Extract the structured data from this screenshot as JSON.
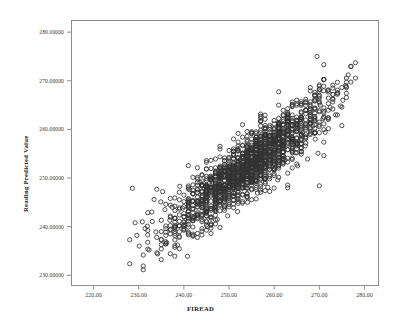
{
  "chart_data": {
    "type": "scatter",
    "title": "",
    "xlabel": "FIREAD",
    "ylabel": "Reading Predicted Value",
    "xlim": [
      215.0,
      283.0
    ],
    "ylim": [
      228.0,
      282.5
    ],
    "xticks": [
      220.0,
      230.0,
      240.0,
      250.0,
      260.0,
      270.0,
      280.0
    ],
    "xtick_labels": [
      "220.00",
      "230.00",
      "240.00",
      "250.00",
      "260.00",
      "270.00",
      "280.00"
    ],
    "yticks": [
      230.0,
      240.0,
      250.0,
      260.0,
      270.0,
      280.0
    ],
    "ytick_labels": [
      "230.00000",
      "240.00000",
      "250.00000",
      "260.00000",
      "270.00000",
      "280.00000"
    ],
    "grid": false,
    "legend": false,
    "marker": "open-circle",
    "marker_size": 4.2,
    "marker_color": "#333333",
    "n_points": 1600,
    "relationship": "strong positive linear",
    "regression": {
      "slope": 0.72,
      "intercept": 69.5,
      "r": 0.86
    },
    "x_range_data": [
      227.0,
      277.0
    ],
    "y_range_data": [
      232.5,
      275.0
    ],
    "x_mean": 254.5,
    "y_mean": 253.0,
    "x_sd": 8.6,
    "y_sd": 7.2,
    "residual_sd": 3.0,
    "points": [
      [
        228.6,
        247.9
      ],
      [
        229.2,
        240.8
      ],
      [
        229.6,
        238.2
      ],
      [
        230.1,
        236.0
      ],
      [
        230.8,
        241.0
      ],
      [
        231.4,
        239.6
      ],
      [
        231.9,
        240.1
      ],
      [
        232.3,
        235.2
      ],
      [
        232.9,
        243.0
      ],
      [
        233.4,
        245.6
      ],
      [
        233.8,
        238.9
      ],
      [
        234.2,
        234.4
      ],
      [
        234.9,
        245.1
      ],
      [
        235.3,
        247.2
      ],
      [
        235.8,
        243.5
      ],
      [
        236.2,
        236.7
      ],
      [
        236.9,
        241.3
      ],
      [
        237.4,
        244.0
      ],
      [
        238.0,
        239.0
      ],
      [
        238.6,
        236.2
      ],
      [
        239.1,
        248.3
      ],
      [
        239.7,
        243.8
      ],
      [
        240.2,
        240.5
      ],
      [
        240.8,
        233.9
      ],
      [
        241.3,
        247.6
      ],
      [
        241.9,
        245.2
      ],
      [
        242.4,
        242.0
      ],
      [
        243.0,
        238.6
      ],
      [
        243.6,
        249.1
      ],
      [
        244.1,
        246.4
      ],
      [
        244.7,
        243.2
      ],
      [
        245.2,
        240.0
      ],
      [
        245.8,
        250.3
      ],
      [
        246.3,
        247.0
      ],
      [
        246.9,
        244.1
      ],
      [
        247.4,
        241.5
      ],
      [
        248.0,
        251.2
      ],
      [
        248.6,
        248.3
      ],
      [
        249.1,
        245.6
      ],
      [
        249.7,
        242.2
      ],
      [
        250.2,
        252.5
      ],
      [
        250.8,
        249.4
      ],
      [
        251.3,
        246.8
      ],
      [
        251.9,
        243.1
      ],
      [
        252.4,
        253.7
      ],
      [
        253.0,
        250.9
      ],
      [
        253.6,
        248.0
      ],
      [
        254.1,
        245.0
      ],
      [
        254.7,
        255.1
      ],
      [
        255.2,
        252.3
      ],
      [
        255.8,
        249.5
      ],
      [
        256.3,
        246.9
      ],
      [
        256.9,
        256.4
      ],
      [
        257.4,
        253.6
      ],
      [
        258.0,
        250.8
      ],
      [
        258.6,
        248.1
      ],
      [
        259.1,
        258.0
      ],
      [
        259.7,
        255.0
      ],
      [
        260.2,
        252.2
      ],
      [
        260.8,
        249.6
      ],
      [
        261.3,
        259.3
      ],
      [
        261.9,
        256.5
      ],
      [
        262.4,
        253.7
      ],
      [
        263.0,
        251.0
      ],
      [
        263.6,
        260.8
      ],
      [
        264.1,
        258.0
      ],
      [
        264.7,
        255.2
      ],
      [
        265.2,
        252.5
      ],
      [
        265.8,
        262.1
      ],
      [
        266.3,
        259.3
      ],
      [
        266.9,
        256.6
      ],
      [
        267.4,
        253.9
      ],
      [
        268.0,
        263.5
      ],
      [
        268.6,
        260.7
      ],
      [
        269.1,
        258.0
      ],
      [
        269.7,
        255.1
      ],
      [
        270.2,
        265.0
      ],
      [
        270.8,
        262.2
      ],
      [
        271.3,
        259.4
      ],
      [
        271.9,
        268.0
      ],
      [
        272.4,
        264.5
      ],
      [
        273.0,
        266.2
      ],
      [
        273.6,
        263.0
      ],
      [
        274.1,
        267.5
      ],
      [
        274.7,
        264.8
      ],
      [
        275.2,
        266.0
      ],
      [
        275.8,
        269.0
      ],
      [
        276.4,
        271.2
      ],
      [
        269.5,
        275.0
      ],
      [
        271.0,
        273.3
      ],
      [
        270.0,
        248.4
      ]
    ]
  },
  "frame": {
    "left": 71,
    "top": 20,
    "right": 378,
    "bottom": 285,
    "border_color": "#8c8c8c",
    "background": "#ffffff"
  }
}
